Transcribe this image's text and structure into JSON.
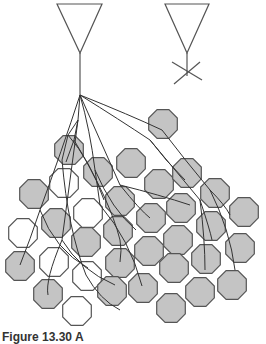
{
  "figure": {
    "caption": "Figure 13.30 A"
  },
  "colors": {
    "stroke": "#555555",
    "fill": "#c4c4c4",
    "empty_fill": "#ffffff"
  },
  "neurons": [
    {
      "name": "neuron-left",
      "triangle": [
        [
          57,
          4
        ],
        [
          102,
          4
        ],
        [
          80,
          53
        ]
      ],
      "axon_end": [
        80,
        95
      ]
    },
    {
      "name": "neuron-right",
      "triangle": [
        [
          165,
          4
        ],
        [
          209,
          4
        ],
        [
          187,
          53
        ]
      ],
      "axon_end": [
        187,
        76
      ]
    }
  ],
  "octagons": [
    {
      "cx": 69,
      "cy": 150,
      "filled": true
    },
    {
      "cx": 98,
      "cy": 172,
      "filled": true
    },
    {
      "cx": 131,
      "cy": 163,
      "filled": true
    },
    {
      "cx": 163,
      "cy": 124,
      "filled": true
    },
    {
      "cx": 159,
      "cy": 184,
      "filled": true
    },
    {
      "cx": 187,
      "cy": 173,
      "filled": true
    },
    {
      "cx": 64,
      "cy": 183,
      "filled": false
    },
    {
      "cx": 34,
      "cy": 194,
      "filled": true
    },
    {
      "cx": 215,
      "cy": 193,
      "filled": true
    },
    {
      "cx": 244,
      "cy": 212,
      "filled": true
    },
    {
      "cx": 56,
      "cy": 223,
      "filled": true
    },
    {
      "cx": 88,
      "cy": 213,
      "filled": false
    },
    {
      "cx": 120,
      "cy": 201,
      "filled": true
    },
    {
      "cx": 151,
      "cy": 218,
      "filled": true
    },
    {
      "cx": 181,
      "cy": 208,
      "filled": true
    },
    {
      "cx": 23,
      "cy": 233,
      "filled": false
    },
    {
      "cx": 86,
      "cy": 242,
      "filled": true
    },
    {
      "cx": 118,
      "cy": 231,
      "filled": true
    },
    {
      "cx": 211,
      "cy": 226,
      "filled": true
    },
    {
      "cx": 178,
      "cy": 240,
      "filled": true
    },
    {
      "cx": 240,
      "cy": 248,
      "filled": true
    },
    {
      "cx": 20,
      "cy": 266,
      "filled": true
    },
    {
      "cx": 54,
      "cy": 262,
      "filled": false
    },
    {
      "cx": 87,
      "cy": 276,
      "filled": false
    },
    {
      "cx": 120,
      "cy": 263,
      "filled": true
    },
    {
      "cx": 149,
      "cy": 251,
      "filled": true
    },
    {
      "cx": 206,
      "cy": 259,
      "filled": true
    },
    {
      "cx": 174,
      "cy": 268,
      "filled": true
    },
    {
      "cx": 143,
      "cy": 288,
      "filled": true
    },
    {
      "cx": 112,
      "cy": 291,
      "filled": true
    },
    {
      "cx": 48,
      "cy": 294,
      "filled": true
    },
    {
      "cx": 77,
      "cy": 311,
      "filled": false
    },
    {
      "cx": 200,
      "cy": 292,
      "filled": true
    },
    {
      "cx": 232,
      "cy": 285,
      "filled": true
    },
    {
      "cx": 171,
      "cy": 308,
      "filled": true
    }
  ],
  "branches": [
    "M80,95 L78,120 L68,135 L62,160",
    "M78,120 L74,140 L66,162",
    "M80,95 Q62,150 40,210 Q30,240 20,265",
    "M78,120 Q70,180 62,240 Q45,280 48,295",
    "M80,95 Q90,130 95,170 Q98,190 100,205",
    "M80,95 Q100,140 120,185 Q140,210 150,218",
    "M80,95 Q120,120 150,140 Q175,170 200,200 Q210,230 212,240",
    "M80,95 Q130,115 162,130 Q185,160 210,190 Q225,205 230,215",
    "M150,140 Q165,160 185,180",
    "M120,185 Q160,195 190,205",
    "M68,135 Q90,160 104,200",
    "M74,140 Q110,200 120,240 Q122,250 120,262",
    "M62,240 Q80,270 115,285",
    "M95,170 Q112,210 136,230",
    "M200,200 Q205,240 205,270",
    "M210,190 Q230,230 235,270",
    "M62,160 Q68,230 86,275 Q100,300 120,310",
    "M40,210 Q55,250 88,268",
    "M100,205 Q130,240 142,286"
  ],
  "cross": [
    [
      172,
      62
    ],
    [
      202,
      80
    ],
    [
      200,
      62
    ],
    [
      174,
      84
    ]
  ]
}
